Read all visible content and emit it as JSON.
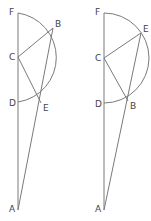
{
  "figures": [
    {
      "id": "left",
      "labels": {
        "F": "F",
        "B": "B",
        "C": "C",
        "D": "D",
        "E": "E",
        "A": "A"
      },
      "points": {
        "F": [
          18,
          13
        ],
        "C": [
          18,
          57
        ],
        "D": [
          18,
          102
        ],
        "A": [
          18,
          210
        ],
        "B": [
          53,
          28
        ],
        "E": [
          41,
          103
        ]
      },
      "radius": 45
    },
    {
      "id": "right",
      "labels": {
        "F": "F",
        "E": "E",
        "C": "C",
        "D": "D",
        "B": "B",
        "A": "A"
      },
      "points": {
        "F": [
          104,
          13
        ],
        "C": [
          104,
          58
        ],
        "D": [
          104,
          103
        ],
        "A": [
          104,
          210
        ],
        "E": [
          141,
          33
        ],
        "B": [
          128,
          101
        ]
      },
      "radius": 45
    }
  ]
}
